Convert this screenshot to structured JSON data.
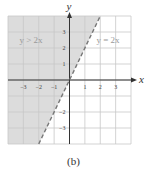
{
  "caption": "(b)",
  "colors": {
    "shade": "#dcdcdc",
    "grid": "#c8c8c8",
    "axis": "#333333",
    "boundary": "#777777",
    "label": "#999999",
    "tick": "#444444"
  },
  "chart_data": {
    "type": "line",
    "title": "",
    "xlabel": "x",
    "ylabel": "y",
    "xlim": [
      -4,
      4
    ],
    "ylim": [
      -4,
      4
    ],
    "grid": true,
    "x_ticks": [
      -3,
      -2,
      -1,
      1,
      2,
      3
    ],
    "y_ticks": [
      -3,
      -2,
      1,
      2,
      3
    ],
    "series": [
      {
        "name": "y = 2x",
        "style": "dashed",
        "points": [
          [
            -2,
            -4
          ],
          [
            2,
            4
          ]
        ]
      }
    ],
    "shaded_region": {
      "inequality": "y > 2x",
      "description": "region above/left of dashed line y = 2x is shaded"
    },
    "annotations": [
      {
        "text": "y > 2x",
        "x": -2.5,
        "y": 2.3
      },
      {
        "text": "y = 2x",
        "x": 2.5,
        "y": 2.3
      }
    ],
    "caption": "(b)"
  }
}
